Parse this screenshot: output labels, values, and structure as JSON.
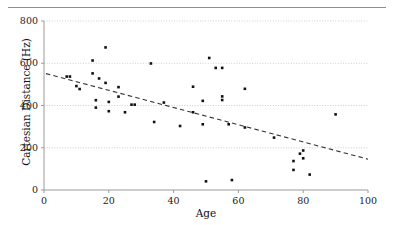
{
  "chart_data": {
    "type": "scatter",
    "title": "",
    "xlabel": "Age",
    "ylabel": "Cartesian Distance (Hz)",
    "xlim": [
      0,
      100
    ],
    "ylim": [
      0,
      800
    ],
    "xticks": [
      0,
      20,
      40,
      60,
      80,
      100
    ],
    "yticks": [
      0,
      200,
      400,
      600,
      800
    ],
    "xtick_labels": [
      "0",
      "20",
      "40",
      "60",
      "80",
      "100"
    ],
    "ytick_labels": [
      "0",
      "200",
      "400",
      "600",
      "800"
    ],
    "grid": "horizontal-dotted",
    "legend": null,
    "marker_color": "#111111",
    "marker_shape": "square",
    "marker_size_px": 2.6,
    "points": [
      {
        "x": 7,
        "y": 537
      },
      {
        "x": 8,
        "y": 537
      },
      {
        "x": 10,
        "y": 492
      },
      {
        "x": 11,
        "y": 478
      },
      {
        "x": 15,
        "y": 613
      },
      {
        "x": 15,
        "y": 552
      },
      {
        "x": 16,
        "y": 425
      },
      {
        "x": 16,
        "y": 390
      },
      {
        "x": 17,
        "y": 528
      },
      {
        "x": 19,
        "y": 675
      },
      {
        "x": 19,
        "y": 507
      },
      {
        "x": 20,
        "y": 417
      },
      {
        "x": 20,
        "y": 373
      },
      {
        "x": 23,
        "y": 442
      },
      {
        "x": 23,
        "y": 487
      },
      {
        "x": 25,
        "y": 368
      },
      {
        "x": 27,
        "y": 404
      },
      {
        "x": 28,
        "y": 404
      },
      {
        "x": 33,
        "y": 599
      },
      {
        "x": 34,
        "y": 322
      },
      {
        "x": 37,
        "y": 414
      },
      {
        "x": 42,
        "y": 303
      },
      {
        "x": 46,
        "y": 489
      },
      {
        "x": 46,
        "y": 368
      },
      {
        "x": 49,
        "y": 422
      },
      {
        "x": 49,
        "y": 311
      },
      {
        "x": 50,
        "y": 41
      },
      {
        "x": 51,
        "y": 625
      },
      {
        "x": 53,
        "y": 578
      },
      {
        "x": 55,
        "y": 578
      },
      {
        "x": 55,
        "y": 443
      },
      {
        "x": 55,
        "y": 426
      },
      {
        "x": 57,
        "y": 311
      },
      {
        "x": 58,
        "y": 47
      },
      {
        "x": 62,
        "y": 479
      },
      {
        "x": 62,
        "y": 296
      },
      {
        "x": 71,
        "y": 248
      },
      {
        "x": 77,
        "y": 137
      },
      {
        "x": 77,
        "y": 95
      },
      {
        "x": 79,
        "y": 172
      },
      {
        "x": 80,
        "y": 187
      },
      {
        "x": 80,
        "y": 150
      },
      {
        "x": 82,
        "y": 73
      },
      {
        "x": 90,
        "y": 358
      }
    ],
    "trendline": {
      "style": "dashed",
      "color": "#333333",
      "x_start": 0.6,
      "y_start": 551,
      "x_end": 100,
      "y_end": 146
    }
  }
}
